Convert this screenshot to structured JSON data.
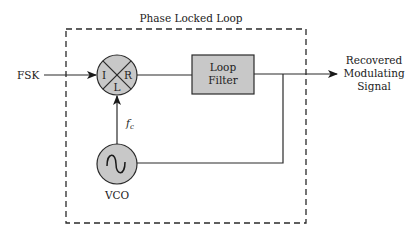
{
  "diagram": {
    "title": "Phase Locked Loop",
    "input_label": "FSK",
    "mixer": {
      "port_i": "I",
      "port_r": "R",
      "port_l": "L"
    },
    "loop_filter": {
      "line1": "Loop",
      "line2": "Filter"
    },
    "vco_label": "VCO",
    "fc_label_base": "f",
    "fc_label_sub": "c",
    "output": {
      "line1": "Recovered",
      "line2": "Modulating",
      "line3": "Signal"
    },
    "colors": {
      "block_fill": "#c8c8c8",
      "line": "#2a2a2a",
      "text": "#222222"
    }
  }
}
